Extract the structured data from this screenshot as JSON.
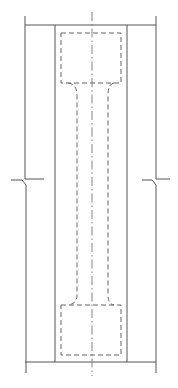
{
  "drawing": {
    "title": "",
    "width": 178,
    "height": 388,
    "colors": {
      "background": "#ffffff",
      "line": "#555555",
      "hidden_line": "#666666",
      "center_line": "#777777"
    },
    "outer_walls": {
      "left": {
        "top_segment": "M25,16 V179 H44",
        "break_segment": "M11,180 H22 L26,185 V373"
      },
      "right": {
        "top_segment": "M156,16 V179 H170",
        "break_segment": "M142,180 H152 L156,185 V373"
      }
    },
    "top_edge": "M25,25 H156",
    "bottom_edge": "M25,362 H156",
    "inner_walls": [
      "M55,25 V362",
      "M127,25 V362"
    ],
    "hidden_outline": {
      "top_block": "M61,33 H121 V83 H61 Z",
      "bottom_block": "M61,305 H121 V355 H61 Z",
      "neck_left": "M68,83 Q77,84 77,95 V295 Q77,304 68,305",
      "neck_right": "M114,83 Q108,84 108,95 V295 Q108,304 114,305"
    },
    "center_line": "M92,12 V376",
    "break_symbols": [
      "left-wall-break",
      "right-wall-break"
    ]
  }
}
